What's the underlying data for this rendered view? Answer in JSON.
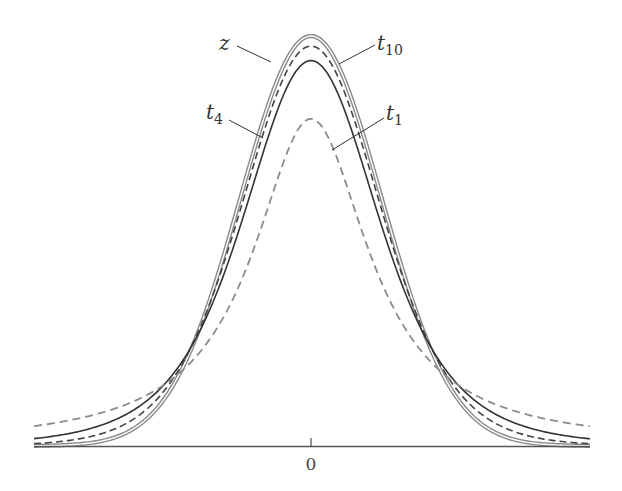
{
  "chart_data": {
    "type": "line",
    "title": "",
    "xlabel": "",
    "ylabel": "",
    "xlim": [
      -4,
      4
    ],
    "ylim": [
      0,
      0.4
    ],
    "grid": false,
    "legend": "inline callout labels",
    "x_ticks": [
      {
        "value": 0,
        "label": "0"
      }
    ],
    "series": [
      {
        "name": "z",
        "label": "z",
        "distribution": "standard normal",
        "df": null,
        "style": "double gray solid",
        "color": "#8a8a8a",
        "peak": 0.399
      },
      {
        "name": "t10",
        "label": "t",
        "sub": "10",
        "distribution": "Student t",
        "df": 10,
        "style": "dashed dark",
        "color": "#444444",
        "peak": 0.389
      },
      {
        "name": "t4",
        "label": "t",
        "sub": "4",
        "distribution": "Student t",
        "df": 4,
        "style": "solid dark",
        "color": "#333333",
        "peak": 0.375
      },
      {
        "name": "t1",
        "label": "t",
        "sub": "1",
        "distribution": "Student t",
        "df": 1,
        "style": "dashed gray",
        "color": "#8c8c8c",
        "peak": 0.318
      }
    ]
  },
  "axis": {
    "zero_label": "0"
  },
  "labels": {
    "z": "z",
    "t10_main": "t",
    "t10_sub": "10",
    "t4_main": "t",
    "t4_sub": "4",
    "t1_main": "t",
    "t1_sub": "1"
  }
}
